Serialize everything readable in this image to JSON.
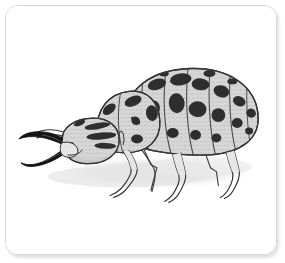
{
  "card": {
    "background_color": "#ffffff",
    "border_color": "#d8d8d8",
    "corner_radius_px": 13,
    "shadow_color": "rgba(120,120,120,0.22)"
  },
  "illustration": {
    "title": "Spotted insect larva with large mandibles",
    "subject": "insect-larva",
    "style": "pen-and-ink stipple drawing",
    "orientation": "facing left, side view",
    "ink_color": "#2b2b2b",
    "body_fill_color": "#d9d9d9",
    "spot_color": "#2e2e2e",
    "mandible_color": "#141414",
    "ground_shadow_color": "#e2e2e2",
    "parts": [
      {
        "name": "upper-mandible",
        "label": "Upper mandible",
        "color": "#141414"
      },
      {
        "name": "lower-mandible",
        "label": "Lower mandible",
        "color": "#141414"
      },
      {
        "name": "head",
        "label": "Head capsule",
        "color": "#d9d9d9"
      },
      {
        "name": "eye",
        "label": "Eye",
        "color": "#2b2b2b"
      },
      {
        "name": "prothorax",
        "label": "Prothorax",
        "color": "#d6d6d6"
      },
      {
        "name": "abdomen",
        "label": "Segmented abdomen",
        "color": "#d6d6d6"
      },
      {
        "name": "legs",
        "label": "Legs",
        "color": "#dedede"
      },
      {
        "name": "ground-shadow",
        "label": "Cast shadow",
        "color": "#e2e2e2"
      }
    ],
    "abdomen_segment_count": 8,
    "leg_count": 6,
    "spot_count": 22
  }
}
